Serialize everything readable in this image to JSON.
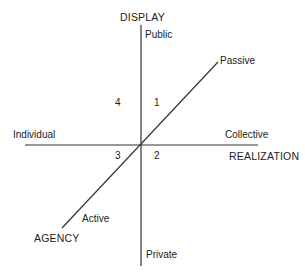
{
  "diagram": {
    "axes": {
      "display": {
        "title": "DISPLAY",
        "top_pole": "Public",
        "bottom_pole": "Private"
      },
      "realization": {
        "title": "REALIZATION",
        "left_pole": "Individual",
        "right_pole": "Collective"
      },
      "agency": {
        "title": "AGENCY",
        "upper_pole": "Passive",
        "lower_pole": "Active"
      }
    },
    "quadrants": {
      "q1": "1",
      "q2": "2",
      "q3": "3",
      "q4": "4"
    },
    "line_color": "#333333"
  }
}
